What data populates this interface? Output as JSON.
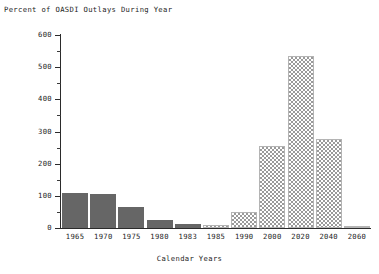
{
  "chart_data": {
    "type": "bar",
    "title": "Percent of OASDI Outlays During Year",
    "xlabel": "Calendar Years",
    "ylabel": "",
    "categories": [
      "1965",
      "1970",
      "1975",
      "1980",
      "1983",
      "1985",
      "1990",
      "2000",
      "2020",
      "2040",
      "2060"
    ],
    "values": [
      110,
      105,
      65,
      25,
      13,
      10,
      50,
      256,
      535,
      278,
      5
    ],
    "series": [
      {
        "name": "Percent of OASDI Outlays During Year",
        "values": [
          110,
          105,
          65,
          25,
          13,
          10,
          50,
          256,
          535,
          278,
          5
        ]
      }
    ],
    "bar_styles": [
      "solid",
      "solid",
      "solid",
      "solid",
      "solid",
      "hatched",
      "hatched",
      "hatched",
      "hatched",
      "hatched",
      "hatched"
    ],
    "ylim": [
      0,
      600
    ],
    "y_ticks": [
      0,
      100,
      200,
      300,
      400,
      500,
      600
    ],
    "y_tick_labels": [
      "0",
      "100",
      "200",
      "300",
      "400",
      "500",
      "600"
    ],
    "y_minor_ticks": [
      50,
      150,
      250,
      350,
      450,
      550
    ],
    "grid": false,
    "legend": null,
    "colors": {
      "historical_bar": "#666666",
      "projected_bar_hatch": "#9a9a9a",
      "axis": "#2b2b2b",
      "text": "#1d1d1d",
      "background": "#ffffff"
    }
  }
}
